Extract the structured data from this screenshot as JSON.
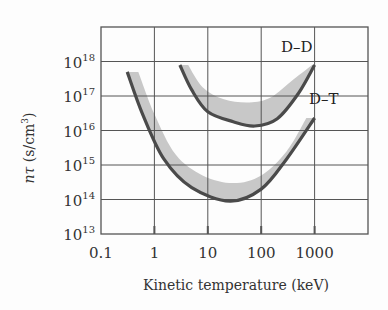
{
  "chart_data": {
    "type": "line",
    "title": "",
    "xlabel": "Kinetic temperature (keV)",
    "ylabel_main": "nτ",
    "ylabel_unit": " (s/cm",
    "ylabel_sup": "3",
    "ylabel_close": ")",
    "xscale": "log",
    "yscale": "log",
    "xlim": [
      0.1,
      10000
    ],
    "ylim": [
      10000000000000.0,
      1e+19
    ],
    "grid": true,
    "x_ticks": [
      {
        "value": 0.1,
        "label": "0.1"
      },
      {
        "value": 1,
        "label": "1"
      },
      {
        "value": 10,
        "label": "10"
      },
      {
        "value": 100,
        "label": "100"
      },
      {
        "value": 1000,
        "label": "1000"
      }
    ],
    "y_ticks": [
      {
        "value": 13,
        "base": "10",
        "exp": "13"
      },
      {
        "value": 14,
        "base": "10",
        "exp": "14"
      },
      {
        "value": 15,
        "base": "10",
        "exp": "15"
      },
      {
        "value": 16,
        "base": "10",
        "exp": "16"
      },
      {
        "value": 17,
        "base": "10",
        "exp": "17"
      },
      {
        "value": 18,
        "base": "10",
        "exp": "18"
      }
    ],
    "series": [
      {
        "name": "D–D",
        "label": "D–D",
        "lower_edge": [
          [
            3,
            7.9e+17
          ],
          [
            5,
            1.5e+17
          ],
          [
            10,
            3.5e+16
          ],
          [
            30,
            1.8e+16
          ],
          [
            76,
            1.35e+16
          ],
          [
            200,
            2.2e+16
          ],
          [
            500,
            1.2e+17
          ],
          [
            1000,
            7.9e+17
          ]
        ],
        "band_upper_edge": [
          [
            4.3,
            7.9e+17
          ],
          [
            8,
            1.8e+17
          ],
          [
            20,
            8e+16
          ],
          [
            60,
            6.5e+16
          ],
          [
            150,
            9e+16
          ],
          [
            400,
            3e+17
          ],
          [
            900,
            7.9e+17
          ]
        ]
      },
      {
        "name": "D–T",
        "label": "D–T",
        "lower_edge": [
          [
            0.31,
            5e+17
          ],
          [
            0.6,
            3e+16
          ],
          [
            1.5,
            1500000000000000.0
          ],
          [
            5,
            220000000000000.0
          ],
          [
            26,
            90000000000000.0
          ],
          [
            100,
            200000000000000.0
          ],
          [
            300,
            1500000000000000.0
          ],
          [
            1000,
            2.3e+16
          ]
        ],
        "band_upper_edge": [
          [
            0.5,
            5e+17
          ],
          [
            1,
            3e+16
          ],
          [
            2.5,
            2000000000000000.0
          ],
          [
            8,
            500000000000000.0
          ],
          [
            30,
            300000000000000.0
          ],
          [
            100,
            500000000000000.0
          ],
          [
            300,
            2500000000000000.0
          ],
          [
            700,
            2.3e+16
          ]
        ]
      }
    ],
    "colors": {
      "curve": "#4a4a4a",
      "band": "#c8c8c8",
      "grid": "#555555"
    }
  }
}
